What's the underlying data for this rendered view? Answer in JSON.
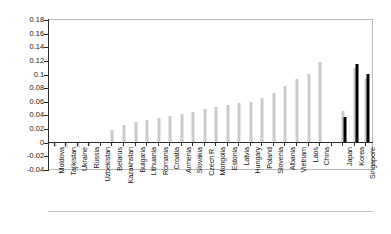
{
  "chart_data": {
    "type": "bar",
    "title": "",
    "subtitle": "",
    "xlabel": "",
    "ylabel": "",
    "ylim": [
      -0.04,
      0.18
    ],
    "ytick_values": [
      0.18,
      0.16,
      0.14,
      0.12,
      0.1,
      0.08,
      0.06,
      0.04,
      0.02,
      0,
      -0.02,
      -0.04
    ],
    "ytick_labels": [
      "0.18",
      "0.16",
      "0.14",
      "0.12",
      "0.1",
      "0.08",
      "0.06",
      "0.04",
      "0.02",
      "0",
      "-0.02",
      "-0.04"
    ],
    "grid": false,
    "legend": "none",
    "categories": [
      "Moldova",
      "Tajikistan",
      "Ukraine",
      "Russia",
      "Uzbekistan",
      "Belarus",
      "Kazakhstan",
      "Bulgaria",
      "Lithuania",
      "Romania",
      "Croatia",
      "Armenia",
      "Slovakia",
      "Czech R.",
      "Mongolia",
      "Estonia",
      "Latvia",
      "Hungary",
      "Poland",
      "Slovenia",
      "Albania",
      "Vietnam",
      "Laos",
      "China",
      "",
      "Japan",
      "Korea",
      "Singapore"
    ],
    "series": [
      {
        "name": "gray",
        "color": "#c9c9c9",
        "values": [
          -0.007,
          -0.008,
          -0.007,
          -0.005,
          0.001,
          0.018,
          0.026,
          0.03,
          0.033,
          0.036,
          0.039,
          0.042,
          0.045,
          0.049,
          0.052,
          0.056,
          0.059,
          0.06,
          0.065,
          0.073,
          0.083,
          0.094,
          0.101,
          0.118,
          null,
          0.047,
          0.11,
          0.094
        ]
      },
      {
        "name": "black",
        "color": "#000000",
        "values": [
          null,
          null,
          null,
          null,
          null,
          null,
          null,
          null,
          null,
          null,
          null,
          null,
          null,
          null,
          null,
          null,
          null,
          null,
          null,
          null,
          null,
          null,
          null,
          null,
          null,
          0.038,
          0.115,
          0.101
        ]
      }
    ]
  }
}
